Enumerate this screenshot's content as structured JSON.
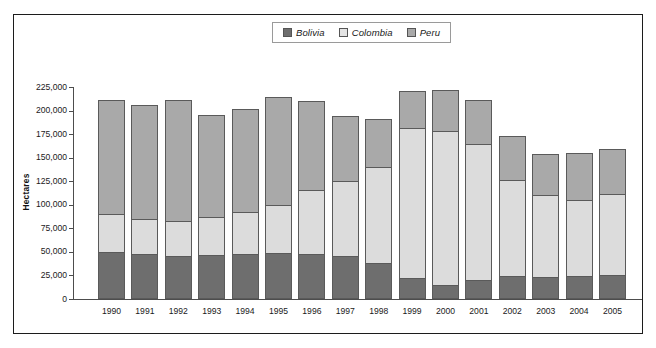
{
  "chart_data": {
    "type": "bar",
    "subtype": "stacked-bar",
    "title": "",
    "subtitle": "",
    "xlabel": "",
    "ylabel": "Hectares",
    "categories": [
      "1990",
      "1991",
      "1992",
      "1993",
      "1994",
      "1995",
      "1996",
      "1997",
      "1998",
      "1999",
      "2000",
      "2001",
      "2002",
      "2003",
      "2004",
      "2005"
    ],
    "series": [
      {
        "name": "Bolivia",
        "color": "#6e6e6e",
        "values": [
          50300,
          47900,
          45500,
          47200,
          48100,
          48600,
          48100,
          45800,
          38000,
          21800,
          14600,
          19900,
          24400,
          23600,
          24600,
          25400
        ]
      },
      {
        "name": "Colombia",
        "color": "#dcdcdc",
        "values": [
          40100,
          37500,
          37100,
          39700,
          44700,
          50900,
          67200,
          79400,
          101800,
          160100,
          163300,
          144800,
          102000,
          86300,
          80300,
          86000
        ]
      },
      {
        "name": "Peru",
        "color": "#a9a9a9",
        "values": [
          121300,
          120800,
          129100,
          108800,
          108600,
          115300,
          94400,
          68800,
          51000,
          38700,
          43400,
          46200,
          46700,
          44200,
          50300,
          48200
        ]
      }
    ],
    "totals": [
      211700,
      206200,
      211700,
      195700,
      201400,
      214800,
      209700,
      194000,
      190800,
      220600,
      221300,
      210900,
      173100,
      154100,
      155200,
      159600
    ],
    "ytick_labels": [
      "225,000",
      "200,000",
      "175,000",
      "150,000",
      "125,000",
      "100,000",
      "75,000",
      "50,000",
      "25,000",
      "0"
    ],
    "ytick_values": [
      225000,
      200000,
      175000,
      150000,
      125000,
      100000,
      75000,
      50000,
      25000,
      0
    ],
    "ylim": [
      0,
      225000
    ],
    "grid": false,
    "legend_position": "top-center"
  },
  "legend": {
    "items": [
      {
        "label": "Bolivia",
        "color": "#6e6e6e"
      },
      {
        "label": "Colombia",
        "color": "#e4e4e4"
      },
      {
        "label": "Peru",
        "color": "#a9a9a9"
      }
    ]
  },
  "axis": {
    "y_title": "Hectares"
  }
}
